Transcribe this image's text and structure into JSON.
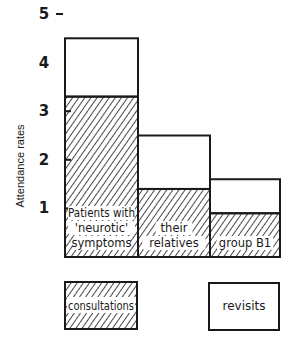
{
  "chart_data": {
    "type": "bar",
    "stacked": true,
    "title": "",
    "xlabel": "",
    "ylabel": "Attendance rates",
    "ylim": [
      0,
      5
    ],
    "yticks": [
      1,
      2,
      3,
      4,
      5
    ],
    "categories": [
      "Patients with 'neurotic' symptoms",
      "their relatives",
      "group B1"
    ],
    "category_labels": [
      [
        "Patients with",
        "'neurotic'",
        "symptoms"
      ],
      [
        "their",
        "relatives"
      ],
      [
        "group B1"
      ]
    ],
    "series": [
      {
        "name": "consultations",
        "pattern": "hatched",
        "values": [
          3.3,
          1.4,
          0.9
        ]
      },
      {
        "name": "revisits",
        "pattern": "blank",
        "values": [
          1.2,
          1.1,
          0.7
        ]
      }
    ],
    "totals": [
      4.5,
      2.5,
      1.6
    ],
    "legend": {
      "position": "bottom",
      "entries": [
        "consultations",
        "revisits"
      ]
    },
    "grid": false
  },
  "axis": {
    "ylabel": "Attendance rates",
    "ticks": [
      "1",
      "2",
      "3",
      "4",
      "5"
    ]
  },
  "legend": {
    "consultations": "consultations",
    "revisits": "revisits"
  },
  "colors": {
    "ink": "#1a1a1a",
    "background": "#ffffff"
  }
}
